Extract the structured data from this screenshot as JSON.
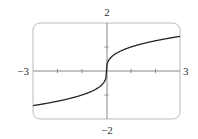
{
  "chart_data": {
    "type": "line",
    "title": "",
    "function": "y = x^(1/3)",
    "xlabel": "",
    "ylabel": "",
    "xlim": [
      -3,
      3
    ],
    "ylim": [
      -2,
      2
    ],
    "x_ticks": [
      -2,
      -1,
      1,
      2
    ],
    "y_ticks": [
      -1,
      1
    ],
    "grid": false,
    "axis_labels": {
      "x_min": "−3",
      "x_max": "3",
      "y_max": "2",
      "y_min": "−2"
    },
    "series": [
      {
        "name": "cube root",
        "x": [
          -3,
          -2.5,
          -2,
          -1.5,
          -1,
          -0.5,
          -0.2,
          -0.05,
          0,
          0.05,
          0.2,
          0.5,
          1,
          1.5,
          2,
          2.5,
          3
        ],
        "values": [
          -1.442,
          -1.357,
          -1.26,
          -1.145,
          -1.0,
          -0.794,
          -0.585,
          -0.368,
          0,
          0.368,
          0.585,
          0.794,
          1.0,
          1.145,
          1.26,
          1.357,
          1.442
        ]
      }
    ],
    "colors": {
      "frame": "#bbbbbb",
      "axes": "#888888",
      "curve": "#222222"
    }
  }
}
